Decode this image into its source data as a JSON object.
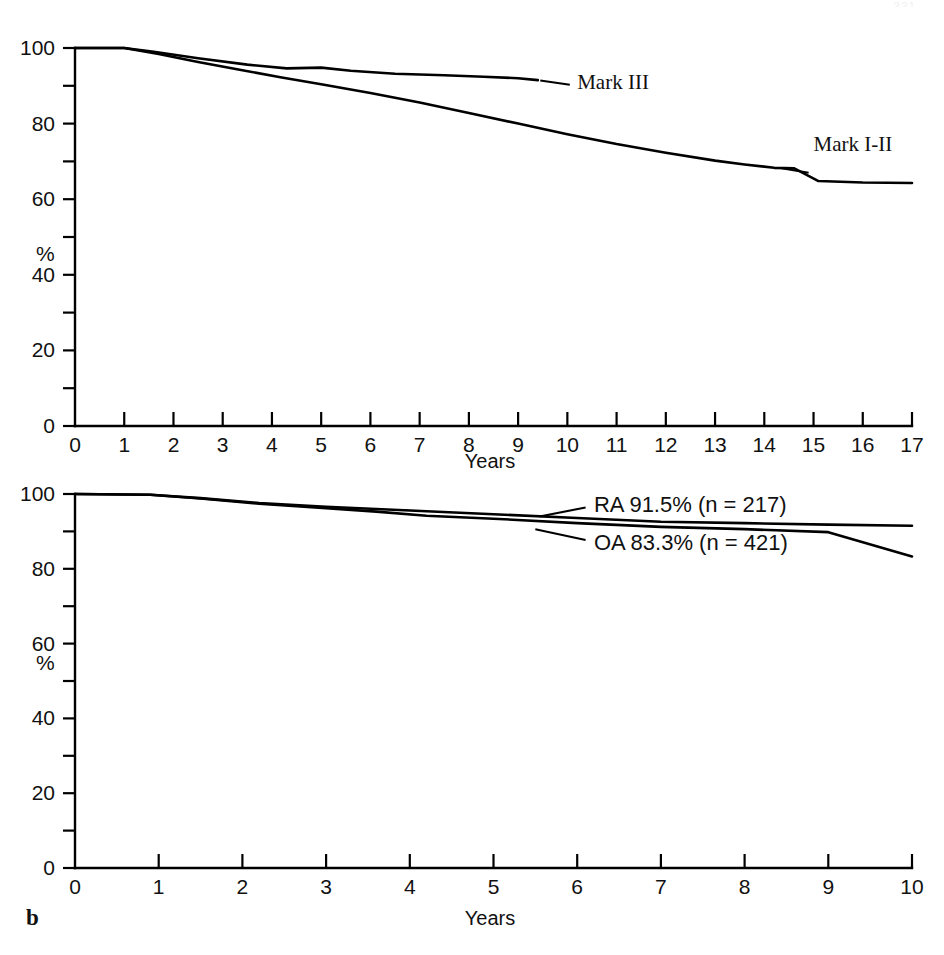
{
  "running_head": {
    "right_text": "331"
  },
  "figure": {
    "panels": [
      {
        "letter": "a",
        "xlabel": "Years",
        "ylabel": "%",
        "series_labels": [
          "Mark III",
          "Mark I-II"
        ]
      },
      {
        "letter": "b",
        "xlabel": "Years",
        "ylabel": "%",
        "series_labels": [
          "RA  91.5%  (n = 217)",
          "OA  83.3%  (n = 421)"
        ]
      }
    ]
  },
  "chart_data": [
    {
      "type": "line",
      "panel": "a",
      "title": "",
      "xlabel": "Years",
      "ylabel": "%",
      "xlim": [
        0,
        17
      ],
      "ylim": [
        0,
        100
      ],
      "xticks": [
        0,
        1,
        2,
        3,
        4,
        5,
        6,
        7,
        8,
        9,
        10,
        11,
        12,
        13,
        14,
        15,
        16,
        17
      ],
      "xticklabels": [
        "0",
        "1",
        "2",
        "3",
        "4",
        "5",
        "6",
        "7",
        "8",
        "9",
        "10",
        "11",
        "12",
        "13",
        "14",
        "15",
        "16",
        "17"
      ],
      "yticks": [
        0,
        20,
        40,
        60,
        80,
        100
      ],
      "yticklabels": [
        "0",
        "20",
        "40",
        "60",
        "80",
        "100"
      ],
      "yticks_minor": [
        10,
        30,
        50,
        70,
        90
      ],
      "grid": false,
      "legend": "inline-annotations",
      "series": [
        {
          "name": "Mark III",
          "x": [
            0,
            1,
            1.6,
            2.5,
            3.5,
            4.3,
            5.0,
            5.6,
            6.5,
            7.5,
            8.3,
            9.0,
            9.4
          ],
          "y": [
            100,
            100,
            99.0,
            97.3,
            95.6,
            94.6,
            94.8,
            94.0,
            93.2,
            92.8,
            92.4,
            92.0,
            91.5
          ]
        },
        {
          "name": "Mark I-II",
          "x": [
            0,
            1,
            1.7,
            2.5,
            3.4,
            4.2,
            5.0,
            6.0,
            7.0,
            8.0,
            9.0,
            10.0,
            11.0,
            12.0,
            13.0,
            13.6,
            14.2,
            14.6,
            15.1,
            16.0,
            17.0
          ],
          "y": [
            100,
            100,
            98.4,
            96.3,
            94.1,
            92.2,
            90.4,
            88.1,
            85.6,
            82.8,
            80.0,
            77.2,
            74.6,
            72.3,
            70.2,
            69.2,
            68.3,
            68.2,
            64.8,
            64.4,
            64.3
          ]
        }
      ],
      "annotations": [
        {
          "text": "Mark III",
          "x": 10.2,
          "y": 91.0
        },
        {
          "text": "Mark I-II",
          "x": 15.0,
          "y": 74.5
        }
      ]
    },
    {
      "type": "line",
      "panel": "b",
      "title": "",
      "xlabel": "Years",
      "ylabel": "%",
      "xlim": [
        0,
        10
      ],
      "ylim": [
        0,
        100
      ],
      "xticks": [
        0,
        1,
        2,
        3,
        4,
        5,
        6,
        7,
        8,
        9,
        10
      ],
      "xticklabels": [
        "0",
        "1",
        "2",
        "3",
        "4",
        "5",
        "6",
        "7",
        "8",
        "9",
        "10"
      ],
      "yticks": [
        0,
        20,
        40,
        60,
        80,
        100
      ],
      "yticklabels": [
        "0",
        "20",
        "40",
        "60",
        "80",
        "100"
      ],
      "yticks_minor": [
        10,
        30,
        50,
        70,
        90
      ],
      "grid": false,
      "legend": "inline-annotations",
      "series": [
        {
          "name": "RA",
          "final_value": 91.5,
          "n": 217,
          "x": [
            0,
            0.9,
            1.5,
            2.2,
            3.0,
            3.6,
            4.2,
            5.0,
            6.0,
            7.0,
            8.0,
            9.0,
            10.0
          ],
          "y": [
            100,
            99.8,
            98.9,
            97.6,
            96.6,
            96.0,
            95.4,
            94.6,
            93.6,
            92.6,
            92.2,
            91.8,
            91.5
          ]
        },
        {
          "name": "OA",
          "final_value": 83.3,
          "n": 421,
          "x": [
            0,
            0.9,
            1.5,
            2.2,
            3.0,
            3.6,
            4.2,
            5.0,
            6.0,
            7.0,
            8.0,
            9.0,
            10.0
          ],
          "y": [
            100,
            99.8,
            98.8,
            97.4,
            96.2,
            95.3,
            94.2,
            93.4,
            92.2,
            91.2,
            90.6,
            89.8,
            83.3
          ]
        }
      ],
      "annotations": [
        {
          "text": "RA  91.5%  (n = 217)",
          "x": 6.2,
          "y": 97.0
        },
        {
          "text": "OA  83.3%  (n = 421)",
          "x": 6.2,
          "y": 87.0
        }
      ]
    }
  ]
}
